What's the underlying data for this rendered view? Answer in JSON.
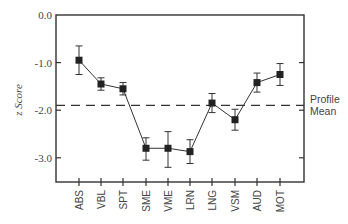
{
  "chart_data": {
    "type": "line",
    "title": "",
    "xlabel": "",
    "ylabel": "z Score",
    "ylim": [
      -3.5,
      0.0
    ],
    "yticks": [
      "0.0",
      "-1.0",
      "-2.0",
      "-3.0"
    ],
    "ytick_values": [
      0.0,
      -1.0,
      -2.0,
      -3.0
    ],
    "grid": false,
    "categories": [
      "ABS",
      "VBL",
      "SPT",
      "SME",
      "VME",
      "LRN",
      "LNG",
      "VSM",
      "AUD",
      "MOT"
    ],
    "series": [
      {
        "name": "z Score",
        "values": [
          -0.95,
          -1.45,
          -1.55,
          -2.8,
          -2.8,
          -2.87,
          -1.85,
          -2.2,
          -1.42,
          -1.25
        ],
        "error_low": [
          -1.25,
          -1.58,
          -1.68,
          -3.05,
          -3.2,
          -3.12,
          -2.05,
          -2.42,
          -1.62,
          -1.48
        ],
        "error_high": [
          -0.65,
          -1.32,
          -1.42,
          -2.58,
          -2.45,
          -2.62,
          -1.65,
          -1.98,
          -1.22,
          -1.02
        ]
      }
    ],
    "reference_line": {
      "label_line1": "Profile",
      "label_line2": "Mean",
      "value": -1.9,
      "style": "dashed"
    },
    "legend": "none"
  }
}
